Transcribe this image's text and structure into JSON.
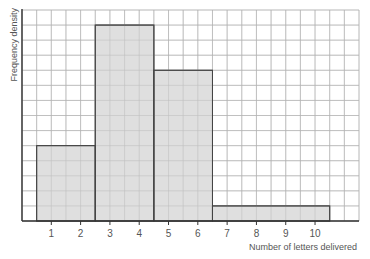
{
  "chart_data": {
    "type": "bar",
    "subtype": "histogram",
    "title": "",
    "xlabel": "Number of letters delivered",
    "ylabel": "Frequency density",
    "x_ticks": [
      1,
      2,
      3,
      4,
      5,
      6,
      7,
      8,
      9,
      10
    ],
    "bins": [
      {
        "from": 0.5,
        "to": 2.5,
        "frequency_density": 5
      },
      {
        "from": 2.5,
        "to": 4.5,
        "frequency_density": 13
      },
      {
        "from": 4.5,
        "to": 6.5,
        "frequency_density": 10
      },
      {
        "from": 6.5,
        "to": 10.5,
        "frequency_density": 1
      }
    ],
    "categories": [
      "1-2",
      "3-4",
      "5-6",
      "7-10"
    ],
    "values": [
      5,
      13,
      10,
      1
    ],
    "xlim": [
      0,
      11.5
    ],
    "ylim": [
      0,
      14
    ],
    "y_tick_labels_shown": false,
    "grid": true,
    "grid_minor_x": 0.5,
    "grid_minor_y": 1,
    "legend": null
  },
  "style": {
    "bar_fill": "#d9d9d9",
    "bar_stroke": "#444444",
    "grid_color": "#b5b5b5",
    "axis_color": "#333333",
    "text_color": "#555555"
  }
}
